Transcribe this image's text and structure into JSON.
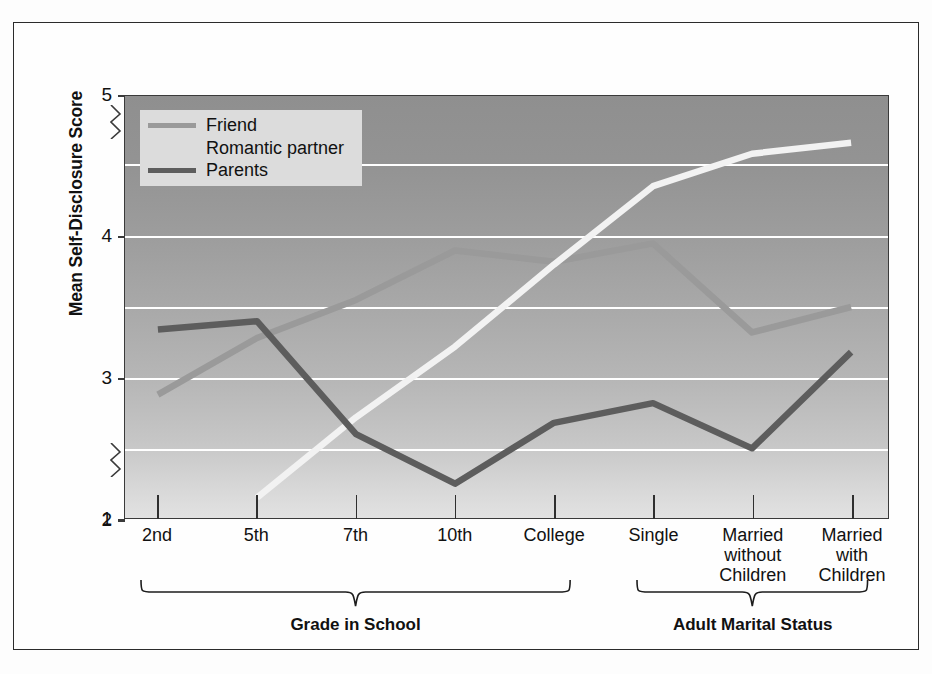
{
  "figure": {
    "y_axis_title": "Mean Self-Disclosure Score"
  },
  "legend": {
    "items": [
      {
        "label": "Friend",
        "color": "#9a9a9a",
        "swatch_visible": true
      },
      {
        "label": "Romantic partner",
        "color": "#f2f2f2",
        "swatch_visible": false
      },
      {
        "label": "Parents",
        "color": "#5d5d5d",
        "swatch_visible": true
      }
    ]
  },
  "groups": [
    {
      "label": "Grade in School",
      "from": 0,
      "to": 4
    },
    {
      "label": "Adult Marital Status",
      "from": 5,
      "to": 7
    }
  ],
  "chart_data": {
    "type": "line",
    "title": "",
    "xlabel": "",
    "ylabel": "Mean Self-Disclosure Score",
    "ylim": [
      1,
      5
    ],
    "yticks": [
      1,
      2,
      3,
      4,
      5
    ],
    "ytick_labels": [
      "1",
      "2",
      "3",
      "4",
      "5"
    ],
    "y_axis_breaks": [
      [
        1,
        2
      ],
      [
        4,
        5
      ]
    ],
    "grid": true,
    "gridlines": [
      2.0,
      2.5,
      3.0,
      3.5,
      4.0,
      4.5
    ],
    "legend_position": "top-left",
    "categories": [
      "2nd",
      "5th",
      "7th",
      "10th",
      "College",
      "Single",
      "Married without Children",
      "Married with Children"
    ],
    "category_lines": [
      [
        "2nd"
      ],
      [
        "5th"
      ],
      [
        "7th"
      ],
      [
        "10th"
      ],
      [
        "College"
      ],
      [
        "Single"
      ],
      [
        "Married",
        "without",
        "Children"
      ],
      [
        "Married",
        "with",
        "Children"
      ]
    ],
    "series": [
      {
        "name": "Friend",
        "color": "#9a9a9a",
        "values": [
          2.88,
          3.28,
          3.55,
          3.9,
          3.82,
          3.95,
          3.32,
          3.5
        ]
      },
      {
        "name": "Romantic partner",
        "color": "#f2f2f2",
        "values": [
          null,
          2.15,
          2.72,
          3.22,
          3.8,
          4.35,
          4.58,
          4.66
        ]
      },
      {
        "name": "Parents",
        "color": "#5d5d5d",
        "values": [
          3.34,
          3.4,
          2.6,
          2.25,
          2.68,
          2.82,
          2.5,
          3.18
        ]
      }
    ]
  }
}
